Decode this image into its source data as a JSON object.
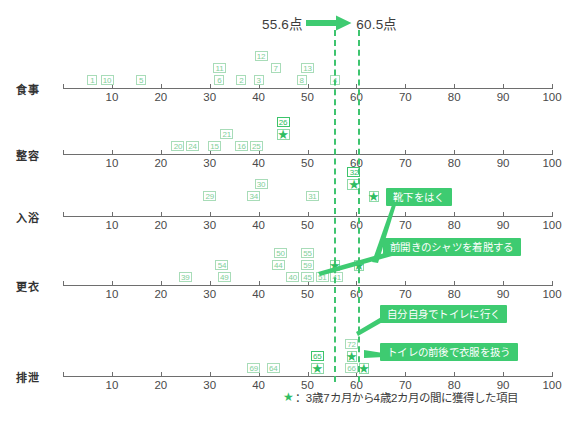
{
  "header": {
    "before_label": "55.6点",
    "after_label": "60.5点",
    "arrow_icon": "right-arrow-icon",
    "arrow_color": "#3ecb71"
  },
  "legend": {
    "star_icon": "star-icon",
    "text": "：3歳7カ月から4歳2カ月の間に獲得した項目"
  },
  "reference_lines": [
    {
      "name": "before-line",
      "value": 55.6,
      "color": "#3ec46f"
    },
    {
      "name": "after-line",
      "value": 60.5,
      "color": "#3ec46f"
    }
  ],
  "callouts": [
    {
      "name": "callout-socks",
      "text": "靴下をはく",
      "x": 386,
      "y": 188
    },
    {
      "name": "callout-shirt",
      "text": "前開きのシャツを着脱する",
      "x": 383,
      "y": 238
    },
    {
      "name": "callout-toilet-go",
      "text": "自分自身でトイレに行く",
      "x": 380,
      "y": 305
    },
    {
      "name": "callout-toilet-clothes",
      "text": "トイレの前後で衣服を扱う",
      "x": 380,
      "y": 343
    }
  ],
  "chart_data": {
    "type": "scatter",
    "title": "",
    "xlabel": "",
    "ylabel": "",
    "xlim": [
      0,
      100
    ],
    "xticks": [
      10,
      20,
      30,
      40,
      50,
      60,
      70,
      80,
      90,
      100
    ],
    "grid": false,
    "legend_position": "bottom-right",
    "annotations": [
      "55.6点",
      "60.5点",
      "靴下をはく",
      "前開きのシャツを着脱する",
      "自分自身でトイレに行く",
      "トイレの前後で衣服を扱う"
    ],
    "categories": [
      "食事",
      "整容",
      "入浴",
      "更衣",
      "排泄"
    ],
    "series": [
      {
        "name": "食事",
        "points": [
          {
            "label": "1",
            "x": 6,
            "tier": 0,
            "acquired": false
          },
          {
            "label": "10",
            "x": 9,
            "tier": 0,
            "acquired": false
          },
          {
            "label": "5",
            "x": 16,
            "tier": 0,
            "acquired": false
          },
          {
            "label": "11",
            "x": 32,
            "tier": 1,
            "acquired": false
          },
          {
            "label": "6",
            "x": 32,
            "tier": 0,
            "acquired": false
          },
          {
            "label": "2",
            "x": 36.5,
            "tier": 0,
            "acquired": false
          },
          {
            "label": "12",
            "x": 40.5,
            "tier": 2,
            "acquired": false
          },
          {
            "label": "3",
            "x": 40,
            "tier": 0,
            "acquired": false
          },
          {
            "label": "7",
            "x": 43.5,
            "tier": 1,
            "acquired": false
          },
          {
            "label": "13",
            "x": 50,
            "tier": 1,
            "acquired": false
          },
          {
            "label": "8",
            "x": 48.8,
            "tier": 0,
            "acquired": false
          },
          {
            "label": "4",
            "x": 55.6,
            "tier": 0,
            "acquired": false
          }
        ]
      },
      {
        "name": "整容",
        "points": [
          {
            "label": "20",
            "x": 23.5,
            "tier": 0,
            "acquired": false
          },
          {
            "label": "24",
            "x": 26.5,
            "tier": 0,
            "acquired": false
          },
          {
            "label": "15",
            "x": 31,
            "tier": 0,
            "acquired": false
          },
          {
            "label": "21",
            "x": 33.5,
            "tier": 1,
            "acquired": false
          },
          {
            "label": "16",
            "x": 36.5,
            "tier": 0,
            "acquired": false
          },
          {
            "label": "25",
            "x": 39.5,
            "tier": 0,
            "acquired": false
          },
          {
            "label": "26",
            "x": 45,
            "tier": 1,
            "acquired": true
          }
        ]
      },
      {
        "name": "入浴",
        "points": [
          {
            "label": "29",
            "x": 30,
            "tier": 1,
            "acquired": false
          },
          {
            "label": "34",
            "x": 39,
            "tier": 1,
            "acquired": false
          },
          {
            "label": "30",
            "x": 40.5,
            "tier": 2,
            "acquired": false
          },
          {
            "label": "31",
            "x": 51,
            "tier": 1,
            "acquired": false
          },
          {
            "label": "32",
            "x": 59.5,
            "tier": 2,
            "acquired": true
          },
          {
            "label": "",
            "x": 63.5,
            "tier": 1,
            "acquired": true
          }
        ]
      },
      {
        "name": "更衣",
        "points": [
          {
            "label": "39",
            "x": 25,
            "tier": 0,
            "acquired": false
          },
          {
            "label": "54",
            "x": 32.5,
            "tier": 1,
            "acquired": false
          },
          {
            "label": "49",
            "x": 33,
            "tier": 0,
            "acquired": false
          },
          {
            "label": "50",
            "x": 44.5,
            "tier": 2,
            "acquired": false
          },
          {
            "label": "44",
            "x": 44,
            "tier": 1,
            "acquired": false
          },
          {
            "label": "40",
            "x": 47,
            "tier": 0,
            "acquired": false
          },
          {
            "label": "55",
            "x": 50,
            "tier": 2,
            "acquired": false
          },
          {
            "label": "59",
            "x": 50,
            "tier": 1,
            "acquired": false
          },
          {
            "label": "45",
            "x": 50,
            "tier": 0,
            "acquired": false
          },
          {
            "label": "51",
            "x": 53,
            "tier": 0,
            "acquired": false
          },
          {
            "label": "",
            "x": 55.6,
            "tier": 1,
            "acquired": true
          },
          {
            "label": "41",
            "x": 56,
            "tier": 0,
            "acquired": false
          },
          {
            "label": "",
            "x": 60.5,
            "tier": 1,
            "acquired": true
          }
        ]
      },
      {
        "name": "排泄",
        "points": [
          {
            "label": "69",
            "x": 39,
            "tier": 0,
            "acquired": false
          },
          {
            "label": "64",
            "x": 43,
            "tier": 0,
            "acquired": false
          },
          {
            "label": "65",
            "x": 52,
            "tier": 0,
            "acquired": true
          },
          {
            "label": "72",
            "x": 59,
            "tier": 2,
            "acquired": false
          },
          {
            "label": "",
            "x": 59,
            "tier": 1,
            "acquired": true
          },
          {
            "label": "66",
            "x": 59,
            "tier": 0,
            "acquired": false
          },
          {
            "label": "",
            "x": 61.5,
            "tier": 0,
            "acquired": true
          }
        ]
      }
    ]
  }
}
